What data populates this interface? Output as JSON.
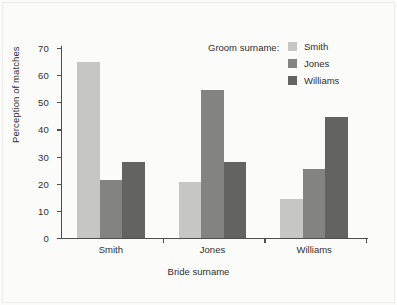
{
  "chart_data": {
    "type": "bar",
    "title": "",
    "xlabel": "Bride surname",
    "ylabel": "Perception of matches",
    "categories": [
      "Smith",
      "Jones",
      "Williams"
    ],
    "series": [
      {
        "name": "Smith",
        "values": [
          65.0,
          20.5,
          14.5
        ],
        "color": "#c6c6c4"
      },
      {
        "name": "Jones",
        "values": [
          21.5,
          54.5,
          25.5
        ],
        "color": "#838382"
      },
      {
        "name": "Williams",
        "values": [
          28.0,
          28.0,
          44.5
        ],
        "color": "#636362"
      }
    ],
    "legend_title": "Groom surname:",
    "legend_position": "top-right-inside",
    "ylim": [
      0,
      70
    ],
    "yticks": [
      0,
      10,
      20,
      30,
      40,
      50,
      60,
      70
    ],
    "ytick_labels": [
      "0",
      "10",
      "20",
      "30",
      "40",
      "50",
      "60",
      "70"
    ],
    "grid": false
  }
}
